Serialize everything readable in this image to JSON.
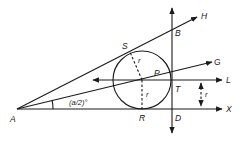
{
  "diagram": {
    "points": {
      "A": "A",
      "B": "B",
      "S": "S",
      "P": "P",
      "T": "T",
      "R": "R",
      "D": "D"
    },
    "rays": {
      "H": "H",
      "G": "G",
      "L": "L",
      "X": "X"
    },
    "radius_label_1": "r",
    "radius_label_2": "r",
    "distance_label": "r",
    "angle_label": "(a/2)°"
  }
}
